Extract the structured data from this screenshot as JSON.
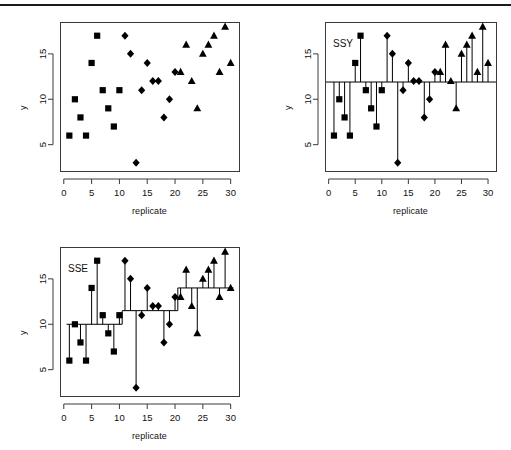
{
  "figure": {
    "background": "#ffffff",
    "rule_color": "#1a1a1a",
    "marker_color": "#000000",
    "axis_color": "#3a3a3a"
  },
  "axes": {
    "xlabel": "replicate",
    "ylabel": "y",
    "xticks": [
      0,
      5,
      10,
      15,
      20,
      25,
      30
    ],
    "yticks": [
      5,
      10,
      15
    ],
    "xlim": [
      -0.5,
      31.5
    ],
    "ylim": [
      2.1,
      18.4
    ]
  },
  "panels": [
    {
      "key": "raw",
      "label": ""
    },
    {
      "key": "ssy",
      "label": "SSY"
    },
    {
      "key": "sse",
      "label": "SSE"
    }
  ],
  "chart_data": [
    {
      "type": "scatter",
      "title": "",
      "xlabel": "replicate",
      "ylabel": "y",
      "xlim": [
        -0.5,
        31.5
      ],
      "ylim": [
        2.1,
        18.4
      ],
      "xticks": [
        0,
        5,
        10,
        15,
        20,
        25,
        30
      ],
      "yticks": [
        5,
        10,
        15
      ],
      "grid": false,
      "legend": "none",
      "x": [
        1,
        2,
        3,
        4,
        5,
        6,
        7,
        8,
        9,
        10,
        11,
        12,
        13,
        14,
        15,
        16,
        17,
        18,
        19,
        20,
        21,
        22,
        23,
        24,
        25,
        26,
        27,
        28,
        29,
        30
      ],
      "values": [
        6,
        10,
        8,
        6,
        14,
        17,
        11,
        9,
        7,
        11,
        17,
        15,
        3,
        11,
        14,
        12,
        12,
        8,
        10,
        13,
        13,
        16,
        12,
        9,
        15,
        16,
        17,
        13,
        18,
        14
      ],
      "series": [
        {
          "name": "group-1",
          "marker": "square",
          "x": [
            1,
            2,
            3,
            4,
            5,
            6,
            7,
            8,
            9,
            10
          ],
          "values": [
            6,
            10,
            8,
            6,
            14,
            17,
            11,
            9,
            7,
            11
          ]
        },
        {
          "name": "group-2",
          "marker": "diamond",
          "x": [
            11,
            12,
            13,
            14,
            15,
            16,
            17,
            18,
            19,
            20
          ],
          "values": [
            17,
            15,
            3,
            11,
            14,
            12,
            12,
            8,
            10,
            13
          ]
        },
        {
          "name": "group-3",
          "marker": "triangle",
          "x": [
            21,
            22,
            23,
            24,
            25,
            26,
            27,
            28,
            29,
            30
          ],
          "values": [
            13,
            16,
            12,
            9,
            15,
            16,
            17,
            13,
            18,
            14
          ]
        }
      ]
    },
    {
      "type": "scatter",
      "title": "SSY",
      "xlabel": "replicate",
      "ylabel": "y",
      "xlim": [
        -0.5,
        31.5
      ],
      "ylim": [
        2.1,
        18.4
      ],
      "xticks": [
        0,
        5,
        10,
        15,
        20,
        25,
        30
      ],
      "yticks": [
        5,
        10,
        15
      ],
      "grid": false,
      "legend": "none",
      "reference_line": 11.9,
      "reference_line_label": "grand mean",
      "x": [
        1,
        2,
        3,
        4,
        5,
        6,
        7,
        8,
        9,
        10,
        11,
        12,
        13,
        14,
        15,
        16,
        17,
        18,
        19,
        20,
        21,
        22,
        23,
        24,
        25,
        26,
        27,
        28,
        29,
        30
      ],
      "values": [
        6,
        10,
        8,
        6,
        14,
        17,
        11,
        9,
        7,
        11,
        17,
        15,
        3,
        11,
        14,
        12,
        12,
        8,
        10,
        13,
        13,
        16,
        12,
        9,
        15,
        16,
        17,
        13,
        18,
        14
      ],
      "series": [
        {
          "name": "group-1",
          "marker": "square",
          "x": [
            1,
            2,
            3,
            4,
            5,
            6,
            7,
            8,
            9,
            10
          ],
          "values": [
            6,
            10,
            8,
            6,
            14,
            17,
            11,
            9,
            7,
            11
          ]
        },
        {
          "name": "group-2",
          "marker": "diamond",
          "x": [
            11,
            12,
            13,
            14,
            15,
            16,
            17,
            18,
            19,
            20
          ],
          "values": [
            17,
            15,
            3,
            11,
            14,
            12,
            12,
            8,
            10,
            13
          ]
        },
        {
          "name": "group-3",
          "marker": "triangle",
          "x": [
            21,
            22,
            23,
            24,
            25,
            26,
            27,
            28,
            29,
            30
          ],
          "values": [
            13,
            16,
            12,
            9,
            15,
            16,
            17,
            13,
            18,
            14
          ]
        }
      ]
    },
    {
      "type": "scatter",
      "title": "SSE",
      "xlabel": "replicate",
      "ylabel": "y",
      "xlim": [
        -0.5,
        31.5
      ],
      "ylim": [
        2.1,
        18.4
      ],
      "xticks": [
        0,
        5,
        10,
        15,
        20,
        25,
        30
      ],
      "yticks": [
        5,
        10,
        15
      ],
      "grid": false,
      "legend": "none",
      "group_means": [
        {
          "name": "group-1",
          "x_from": 0.5,
          "x_to": 10.5,
          "mean": 10.0
        },
        {
          "name": "group-2",
          "x_from": 10.5,
          "x_to": 20.5,
          "mean": 11.5
        },
        {
          "name": "group-3",
          "x_from": 20.5,
          "x_to": 30.5,
          "mean": 14.0
        }
      ],
      "x": [
        1,
        2,
        3,
        4,
        5,
        6,
        7,
        8,
        9,
        10,
        11,
        12,
        13,
        14,
        15,
        16,
        17,
        18,
        19,
        20,
        21,
        22,
        23,
        24,
        25,
        26,
        27,
        28,
        29,
        30
      ],
      "values": [
        6,
        10,
        8,
        6,
        14,
        17,
        11,
        9,
        7,
        11,
        17,
        15,
        3,
        11,
        14,
        12,
        12,
        8,
        10,
        13,
        13,
        16,
        12,
        9,
        15,
        16,
        17,
        13,
        18,
        14
      ],
      "series": [
        {
          "name": "group-1",
          "marker": "square",
          "x": [
            1,
            2,
            3,
            4,
            5,
            6,
            7,
            8,
            9,
            10
          ],
          "values": [
            6,
            10,
            8,
            6,
            14,
            17,
            11,
            9,
            7,
            11
          ]
        },
        {
          "name": "group-2",
          "marker": "diamond",
          "x": [
            11,
            12,
            13,
            14,
            15,
            16,
            17,
            18,
            19,
            20
          ],
          "values": [
            17,
            15,
            3,
            11,
            14,
            12,
            12,
            8,
            10,
            13
          ]
        },
        {
          "name": "group-3",
          "marker": "triangle",
          "x": [
            21,
            22,
            23,
            24,
            25,
            26,
            27,
            28,
            29,
            30
          ],
          "values": [
            13,
            16,
            12,
            9,
            15,
            16,
            17,
            13,
            18,
            14
          ]
        }
      ]
    }
  ]
}
